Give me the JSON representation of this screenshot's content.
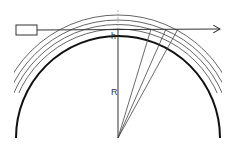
{
  "diagram": {
    "labels": {
      "height": "h",
      "radius": "R"
    },
    "elements": {
      "source_box": "rectangle (emitter/observer)",
      "ray": "horizontal arrow tangent to layers",
      "earth_surface": "thick arc",
      "layers": 4,
      "radial_lines": 3
    },
    "colors": {
      "line": "#333333",
      "earth": "#111111",
      "background": "#ffffff"
    }
  }
}
